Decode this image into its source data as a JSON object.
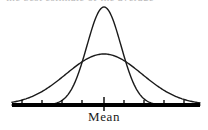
{
  "figure": {
    "title_fragment": "the best estimate of the average",
    "axis_label": "Mean"
  },
  "chart_data": {
    "type": "line",
    "title": "",
    "subtitle": "",
    "xlabel": "",
    "ylabel": "",
    "grid": false,
    "legend_position": "none",
    "annotations": [
      {
        "text": "Mean",
        "x": 104,
        "y": 0,
        "placement": "below-axis-center"
      }
    ],
    "axis": {
      "x_start_px": 12,
      "x_end_px": 200,
      "baseline_y_px": 105,
      "baseline_thickness_px": 4,
      "tick_positions_px": [
        22,
        42,
        62,
        82,
        104,
        124,
        144,
        164,
        184
      ],
      "center_tick_px": 104,
      "center_tick_extends_below": true
    },
    "series": [
      {
        "name": "narrow-tall-distribution",
        "kind": "normal-curve",
        "mean_px": 104,
        "sigma_px": 17,
        "peak_y_px": 7,
        "color": "#1a1a1a",
        "line_width": 1.4,
        "description": "tall narrow bell curve, small standard deviation"
      },
      {
        "name": "wide-flat-distribution",
        "kind": "normal-curve",
        "mean_px": 104,
        "sigma_px": 38,
        "peak_y_px": 54,
        "color": "#1a1a1a",
        "line_width": 1.4,
        "description": "short wide bell curve, large standard deviation"
      }
    ],
    "crossing_points_px": [
      77,
      131
    ],
    "xlim": [
      12,
      200
    ],
    "ylim": [
      105,
      7
    ]
  }
}
